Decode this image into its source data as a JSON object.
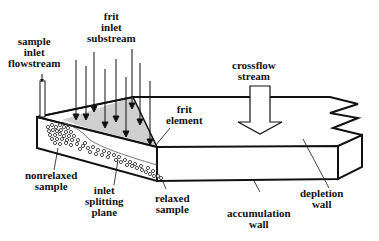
{
  "diagram": {
    "labels": {
      "sample_inlet": [
        "sample",
        "inlet",
        "flowstream"
      ],
      "frit_inlet": [
        "frit",
        "inlet",
        "substream"
      ],
      "crossflow": [
        "crossflow",
        "stream"
      ],
      "frit_element": [
        "frit",
        "element"
      ],
      "nonrelaxed": [
        "nonrelaxed",
        "sample"
      ],
      "inlet_splitting": [
        "inlet",
        "splitting",
        "plane"
      ],
      "relaxed": [
        "relaxed",
        "sample"
      ],
      "accumulation": [
        "accumulation",
        "wall"
      ],
      "depletion": [
        "depletion",
        "wall"
      ]
    },
    "colors": {
      "line": "#111111",
      "frit_shade": "#cccccc",
      "background": "#ffffff"
    }
  }
}
